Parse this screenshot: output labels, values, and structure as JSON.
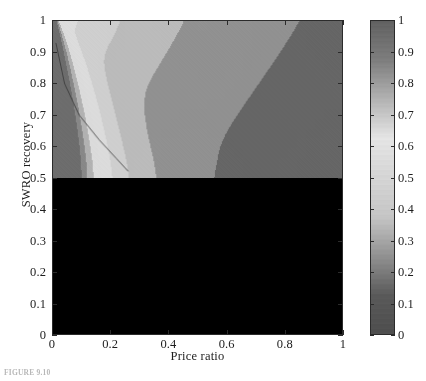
{
  "figure": {
    "caption": "FIGURE 9.10"
  },
  "chart_data": {
    "type": "heatmap",
    "subtype": "filled-contour",
    "title": "",
    "xlabel": "Price  ratio",
    "ylabel": "SWRO  recovery",
    "xlim": [
      0,
      1
    ],
    "ylim": [
      0,
      1
    ],
    "xticks": [
      "0",
      "0.2",
      "0.4",
      "0.6",
      "0.8",
      "1"
    ],
    "xtick_values": [
      0,
      0.2,
      0.4,
      0.6,
      0.8,
      1
    ],
    "yticks": [
      "0",
      "0.1",
      "0.2",
      "0.3",
      "0.4",
      "0.5",
      "0.6",
      "0.7",
      "0.8",
      "0.9",
      "1"
    ],
    "ytick_values": [
      0,
      0.1,
      0.2,
      0.3,
      0.4,
      0.5,
      0.6,
      0.7,
      0.8,
      0.9,
      1
    ],
    "grid": false,
    "legend": "none",
    "colormap": "jet-grayscale",
    "colorbar": {
      "position": "right",
      "orientation": "vertical",
      "min": 0,
      "max": 1,
      "ticks": [
        "0",
        "0.1",
        "0.2",
        "0.3",
        "0.4",
        "0.5",
        "0.6",
        "0.7",
        "0.8",
        "0.9",
        "1"
      ],
      "tick_values": [
        0,
        0.1,
        0.2,
        0.3,
        0.4,
        0.5,
        0.6,
        0.7,
        0.8,
        0.9,
        1
      ]
    },
    "zlim": [
      0,
      1
    ],
    "contour_levels": [
      0.1,
      0.2,
      0.3,
      0.4,
      0.5,
      0.6,
      0.7,
      0.8,
      0.9
    ],
    "annotations": [
      {
        "type": "curve",
        "label": "optimum-locus",
        "points": [
          [
            0.01,
            0.93
          ],
          [
            0.04,
            0.8
          ],
          [
            0.09,
            0.7
          ],
          [
            0.16,
            0.62
          ],
          [
            0.22,
            0.56
          ],
          [
            0.26,
            0.52
          ]
        ]
      }
    ],
    "surface": {
      "peak_xy": [
        0.06,
        0.52
      ],
      "peak_value": 1.0,
      "corner_values": {
        "top_left": 1.0,
        "top_right": 0.08,
        "bottom_left": 0.12,
        "bottom_right": 0.05
      }
    }
  }
}
